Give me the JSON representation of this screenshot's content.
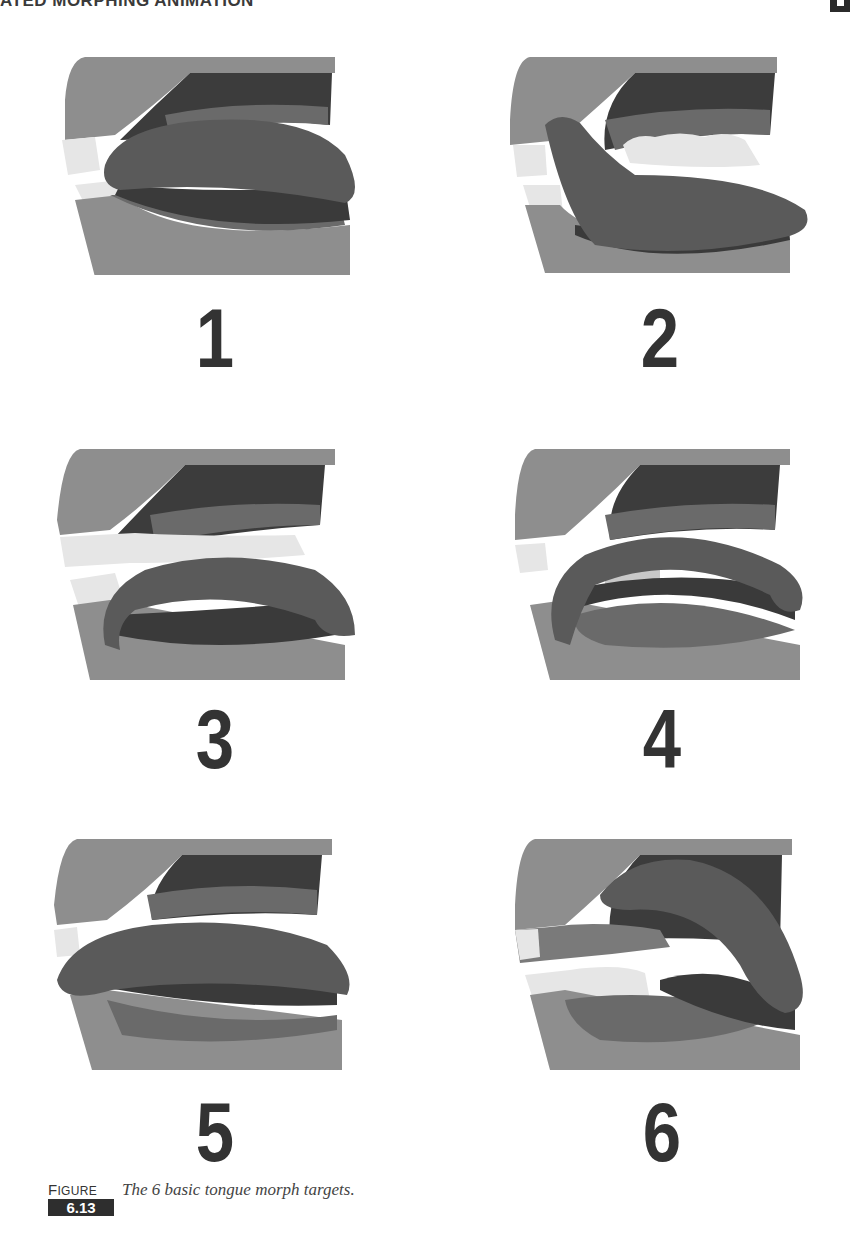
{
  "page": {
    "running_head": "ATED MORPHING ANIMATION",
    "chapter_tab_icon": "chapter-marker"
  },
  "figure": {
    "label_first": "F",
    "label_rest": "IGURE",
    "number": "6.13",
    "caption": "The 6 basic tongue morph targets."
  },
  "panels": [
    {
      "label": "1",
      "pose": "tongue-rest-raised"
    },
    {
      "label": "2",
      "pose": "tongue-forward-protruding"
    },
    {
      "label": "3",
      "pose": "tongue-curled-down"
    },
    {
      "label": "4",
      "pose": "tongue-curled-up-arched"
    },
    {
      "label": "5",
      "pose": "tongue-flat-forward"
    },
    {
      "label": "6",
      "pose": "tongue-raised-back"
    }
  ],
  "colors": {
    "jaw": "#8e8e8e",
    "palate": "#3c3c3c",
    "gum": "#6a6a6a",
    "tongue": "#5a5a5a",
    "tongue_dark": "#3a3a3a",
    "teeth": "#e6e6e6",
    "number": "#333333"
  }
}
